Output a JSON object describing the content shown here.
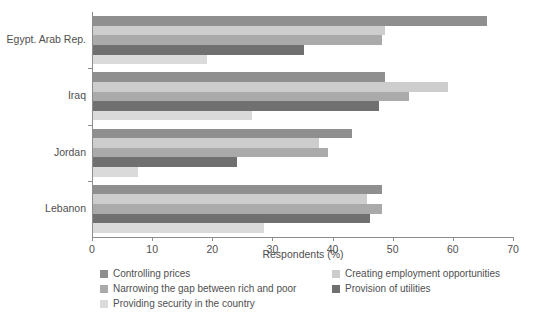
{
  "chart_data": {
    "type": "bar",
    "orientation": "horizontal",
    "title": "",
    "subtitle": "",
    "xlabel": "Respondents (%)",
    "ylabel": "",
    "xlim": [
      0,
      70
    ],
    "xticks": [
      0,
      10,
      20,
      30,
      40,
      50,
      60,
      70
    ],
    "xtick_labels": [
      "0",
      "10",
      "20",
      "30",
      "40",
      "50",
      "60",
      "70"
    ],
    "grid": false,
    "legend_position": "bottom",
    "categories": [
      "Egypt. Arab Rep.",
      "Iraq",
      "Jordan",
      "Lebanon"
    ],
    "series": [
      {
        "name": "Controlling prices",
        "color": "#8f8f8f",
        "values": [
          65.5,
          48.5,
          43.0,
          48.0
        ]
      },
      {
        "name": "Creating employment opportunities",
        "color": "#cdcdcd",
        "values": [
          48.5,
          59.0,
          37.5,
          45.5
        ]
      },
      {
        "name": "Narrowing the gap between rich and poor",
        "color": "#aaaaaa",
        "values": [
          48.0,
          52.5,
          39.0,
          48.0
        ]
      },
      {
        "name": "Provision of utilities",
        "color": "#707070",
        "values": [
          35.0,
          47.5,
          24.0,
          46.0
        ]
      },
      {
        "name": "Providing security in the country",
        "color": "#dadada",
        "values": [
          19.0,
          26.5,
          7.5,
          28.5
        ]
      }
    ]
  },
  "legend": {
    "entries": [
      {
        "label": "Controlling prices",
        "color": "#8f8f8f"
      },
      {
        "label": "Creating employment opportunities",
        "color": "#cdcdcd"
      },
      {
        "label": "Narrowing the gap between rich and poor",
        "color": "#aaaaaa"
      },
      {
        "label": "Provision of utilities",
        "color": "#707070"
      },
      {
        "label": "Providing security in the country",
        "color": "#dadada"
      }
    ]
  },
  "axis": {
    "x_title": "Respondents (%)",
    "tick_0": "0",
    "tick_1": "10",
    "tick_2": "20",
    "tick_3": "30",
    "tick_4": "40",
    "tick_5": "50",
    "tick_6": "60",
    "tick_7": "70"
  },
  "colors": {
    "axis": "#8d8d8d",
    "text": "#4f4f4f",
    "background": "#ffffff"
  }
}
